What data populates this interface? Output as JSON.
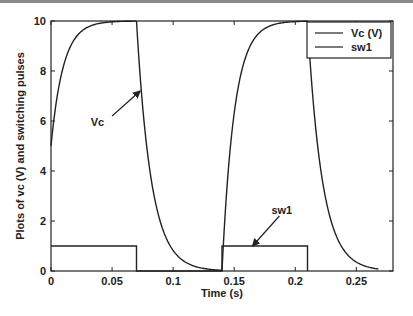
{
  "chart_data": {
    "type": "line",
    "title": "",
    "xlabel": "Time (s)",
    "ylabel": "Plots of vc (V) and switching pulses",
    "xlim": [
      0,
      0.28
    ],
    "ylim": [
      0,
      10
    ],
    "xticks": [
      0,
      0.05,
      0.1,
      0.15,
      0.2,
      0.25
    ],
    "xtick_labels": [
      "0",
      "0.05",
      "0.1",
      "0.15",
      "0.2",
      "0.25"
    ],
    "yticks": [
      0,
      2,
      4,
      6,
      8,
      10
    ],
    "ytick_labels": [
      "0",
      "2",
      "4",
      "6",
      "8",
      "10"
    ],
    "grid": false,
    "legend_position": "upper right",
    "legend": [
      "Vc (V)",
      "sw1"
    ],
    "series": [
      {
        "name": "Vc (V)",
        "color": "#222222",
        "segments": [
          {
            "kind": "charge",
            "t_start": 0.0,
            "t_end": 0.07,
            "v_start": 5.0,
            "v_final": 10.0,
            "tau": 0.01
          },
          {
            "kind": "discharge",
            "t_start": 0.07,
            "t_end": 0.14,
            "v_start": 10.0,
            "v_final": 0.0,
            "tau": 0.012
          },
          {
            "kind": "charge",
            "t_start": 0.14,
            "t_end": 0.21,
            "v_start": 0.0,
            "v_final": 10.0,
            "tau": 0.01
          },
          {
            "kind": "discharge",
            "t_start": 0.21,
            "t_end": 0.268,
            "v_start": 10.0,
            "v_final": 0.0,
            "tau": 0.012
          }
        ]
      },
      {
        "name": "sw1",
        "color": "#222222",
        "x": [
          0,
          0.07,
          0.07,
          0.14,
          0.14,
          0.21,
          0.21
        ],
        "values": [
          1,
          1,
          0,
          0,
          1,
          1,
          0
        ]
      }
    ],
    "annotations": [
      {
        "text": "Vc",
        "text_at": [
          0.038,
          5.8
        ],
        "arrow_from": [
          0.05,
          6.2
        ],
        "arrow_to": [
          0.073,
          7.2
        ]
      },
      {
        "text": "sw1",
        "text_at": [
          0.189,
          2.3
        ],
        "arrow_from": [
          0.187,
          2.2
        ],
        "arrow_to": [
          0.165,
          1.0
        ]
      }
    ]
  }
}
